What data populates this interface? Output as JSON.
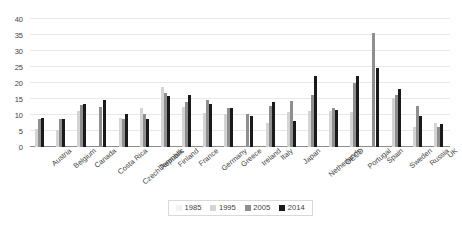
{
  "chart_data": {
    "type": "bar",
    "title": "",
    "xlabel": "",
    "ylabel": "",
    "ylim": [
      0,
      40
    ],
    "yticks": [
      0,
      5,
      10,
      15,
      20,
      25,
      30,
      35,
      40
    ],
    "grid": true,
    "legend_position": "bottom-center",
    "categories": [
      "Austria",
      "Belgium",
      "Canada",
      "Costa Rica",
      "Czech Republic",
      "Denmark",
      "Finland",
      "France",
      "Germany",
      "Greece",
      "Ireland",
      "Italy",
      "Japan",
      "Netherlands",
      "OECD",
      "Portugal",
      "Spain",
      "Sweden",
      "Russia",
      "UK"
    ],
    "series": [
      {
        "name": "1985",
        "color": "#f2f2f2",
        "values": [
          null,
          null,
          null,
          null,
          null,
          null,
          null,
          null,
          null,
          null,
          null,
          null,
          null,
          null,
          null,
          null,
          null,
          null,
          null,
          null
        ]
      },
      {
        "name": "1995",
        "color": "#d4d4d4",
        "values": [
          5.7,
          5.2,
          11.2,
          null,
          9.2,
          12.3,
          18.6,
          12.5,
          10.6,
          10.4,
          null,
          7.6,
          11.0,
          11.4,
          11.3,
          10.8,
          null,
          15.2,
          6.4,
          7.4
        ]
      },
      {
        "name": "2005",
        "color": "#8f8f8f",
        "values": [
          8.9,
          8.7,
          13.1,
          12.4,
          8.8,
          10.2,
          16.8,
          14.2,
          14.6,
          12.2,
          10.4,
          12.7,
          14.5,
          16.1,
          12.3,
          20.0,
          35.5,
          16.4,
          12.9,
          6.4
        ]
      },
      {
        "name": "2014",
        "color": "#1a1a1a",
        "values": [
          9.2,
          8.8,
          13.5,
          14.6,
          10.4,
          8.7,
          16.0,
          16.1,
          13.4,
          12.1,
          9.8,
          14.0,
          8.2,
          22.2,
          11.7,
          22.1,
          24.7,
          18.1,
          9.6,
          7.2
        ]
      }
    ]
  },
  "legend": {
    "entries": [
      {
        "label": "1985"
      },
      {
        "label": "1995"
      },
      {
        "label": "2005"
      },
      {
        "label": "2014"
      }
    ]
  }
}
